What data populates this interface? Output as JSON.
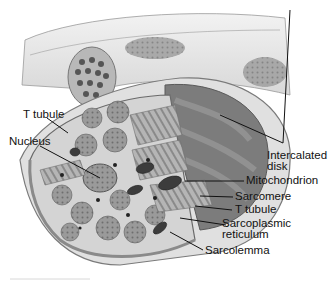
{
  "diagram": {
    "labels": {
      "t_tubule_left": "T tubule",
      "nucleus": "Nucleus",
      "intercalated_disk_line1": "Intercalated",
      "intercalated_disk_line2": "disk",
      "mitochondrion": "Mitochondrion",
      "sarcomere": "Sarcomere",
      "t_tubule_right": "T tubule",
      "sarcoplasmic_reticulum_line1": "Sarcoplasmic",
      "sarcoplasmic_reticulum_line2": "reticulum",
      "sarcolemma": "Sarcolemma"
    },
    "colors": {
      "background": "#ffffff",
      "outer_fiber": "#e6e6e6",
      "membrane": "#8a8a8a",
      "myofibril": "#8c8c8c",
      "dark_structure": "#555555",
      "label_text": "#111111"
    }
  }
}
